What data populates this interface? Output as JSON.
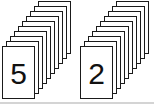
{
  "scene": {
    "description": "Two cascading stacks of number cards above a light gray baseline",
    "background_color": "#ffffff",
    "card": {
      "width": 33,
      "height": 53,
      "fill_color": "#ffffff",
      "border_color": "#1a1a1a",
      "offset_x": 4,
      "offset_y": 5
    },
    "baseline": {
      "color": "#d4d4d4"
    },
    "stacks": [
      {
        "name": "stack-5",
        "front_label": "5",
        "card_count": 10,
        "x": 2,
        "front_y": 46
      },
      {
        "name": "stack-2",
        "front_label": "2",
        "card_count": 10,
        "x": 80,
        "front_y": 46
      }
    ]
  }
}
